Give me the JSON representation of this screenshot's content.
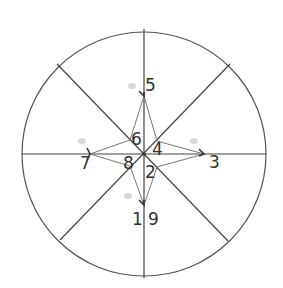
{
  "diagram": {
    "type": "compass-star-in-circle",
    "colors": {
      "circle": "#555555",
      "spokes": "#444444",
      "star": "#777777",
      "arrow": "#333333",
      "label": "#333333"
    },
    "circle": {
      "cx": 144,
      "cy": 154,
      "r": 122
    },
    "spokes": [
      {
        "name": "vertical",
        "x1": 144,
        "y1": 29,
        "x2": 144,
        "y2": 278
      },
      {
        "name": "horizontal",
        "x1": 22,
        "y1": 154,
        "x2": 266,
        "y2": 154
      },
      {
        "name": "diagonal-nw-se",
        "x1": 57,
        "y1": 64,
        "x2": 228,
        "y2": 241
      },
      {
        "name": "diagonal-ne-sw",
        "x1": 230,
        "y1": 64,
        "x2": 60,
        "y2": 240
      }
    ],
    "star_points": "144,96 157,141 204,154 157,167 144,205 130,166 90,154 130,140",
    "arrows": [
      {
        "name": "arrow-north",
        "tip": [
          144,
          96
        ],
        "path": "M139,91 L144,96 L144,92"
      },
      {
        "name": "arrow-east",
        "tip": [
          204,
          154
        ],
        "path": "M199,149 L204,154 L199,156"
      },
      {
        "name": "arrow-west",
        "tip": [
          90,
          154
        ],
        "path": "M87,148 L90,154 L87,160"
      },
      {
        "name": "arrow-south",
        "tip": [
          144,
          205
        ],
        "path": "M139,200 L144,205 L144,200"
      }
    ],
    "labels": [
      {
        "text": "5",
        "x": 145,
        "y": 91
      },
      {
        "text": "6",
        "x": 131,
        "y": 145
      },
      {
        "text": "4",
        "x": 152,
        "y": 155
      },
      {
        "text": "3",
        "x": 209,
        "y": 168
      },
      {
        "text": "7",
        "x": 80,
        "y": 169
      },
      {
        "text": "8",
        "x": 123,
        "y": 169
      },
      {
        "text": "2",
        "x": 145,
        "y": 178
      },
      {
        "text": "1",
        "x": 132,
        "y": 225
      },
      {
        "text": "9",
        "x": 148,
        "y": 225
      }
    ],
    "ghost_marks": [
      {
        "x": 132,
        "y": 86
      },
      {
        "x": 82,
        "y": 141
      },
      {
        "x": 194,
        "y": 141
      },
      {
        "x": 128,
        "y": 196
      }
    ]
  }
}
